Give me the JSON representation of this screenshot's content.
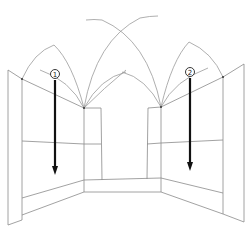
{
  "diagram": {
    "markers": [
      {
        "id": "marker-1",
        "label": "1",
        "x": 55,
        "y": 74
      },
      {
        "id": "marker-2",
        "label": "2",
        "x": 190,
        "y": 72
      }
    ],
    "colors": {
      "line": "#8a8a8a",
      "arrow": "#111111",
      "background": "#ffffff"
    }
  }
}
